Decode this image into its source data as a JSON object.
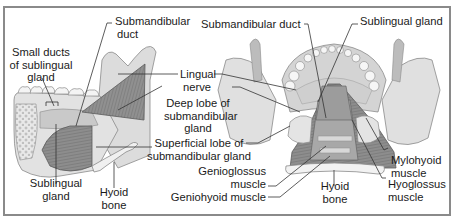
{
  "figure": {
    "left_view": {
      "name": "lateral view",
      "labels": {
        "submandibular_duct_1": "Submandibular",
        "submandibular_duct_2": "duct",
        "small_ducts_1": "Small ducts",
        "small_ducts_2": "of sublingual",
        "small_ducts_3": "gland",
        "sublingual_gland_1": "Sublingual",
        "sublingual_gland_2": "gland",
        "hyoid_bone_1": "Hyoid",
        "hyoid_bone_2": "bone"
      }
    },
    "center_labels": {
      "lingual_nerve_1": "Lingual",
      "lingual_nerve_2": "nerve",
      "deep_lobe_1": "Deep lobe of",
      "deep_lobe_2": "submandibular",
      "deep_lobe_3": "gland",
      "superficial_lobe_1": "Superficial lobe of",
      "superficial_lobe_2": "submandibular gland",
      "genioglossus_1": "Genioglossus",
      "genioglossus_2": "muscle",
      "geniohyoid": "Geniohyoid muscle"
    },
    "right_view": {
      "name": "posterior-superior view",
      "labels": {
        "submandibular_duct": "Submandibular duct",
        "sublingual_gland": "Sublingual gland",
        "mylohyoid_1": "Mylohyoid",
        "mylohyoid_2": "muscle",
        "hyoid_bone_1": "Hyoid",
        "hyoid_bone_2": "bone",
        "hyoglossus_1": "Hyoglossus",
        "hyoglossus_2": "muscle"
      }
    }
  }
}
